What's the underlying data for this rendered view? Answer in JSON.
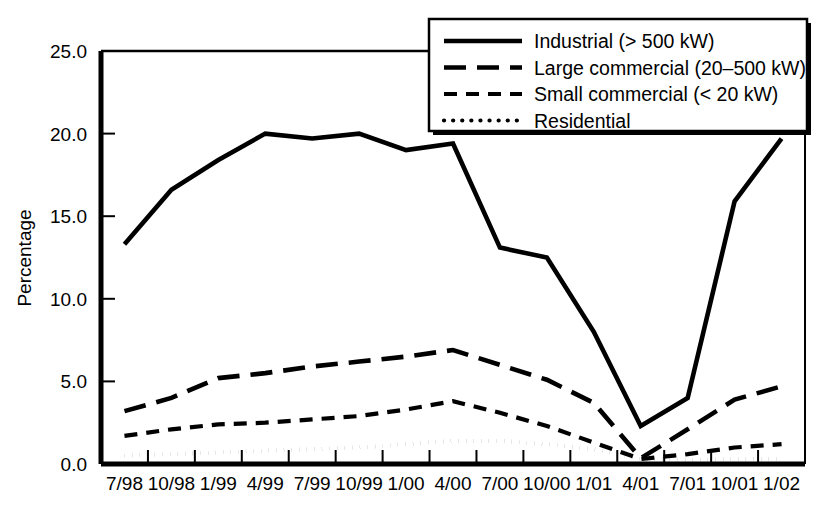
{
  "chart_data": {
    "type": "line",
    "title": "",
    "xlabel": "",
    "ylabel": "Percentage",
    "ylim": [
      0.0,
      25.0
    ],
    "yticks": [
      "0.0",
      "5.0",
      "10.0",
      "15.0",
      "20.0",
      "25.0"
    ],
    "ytick_values": [
      0.0,
      5.0,
      10.0,
      15.0,
      20.0,
      25.0
    ],
    "grid": false,
    "legend_position": "top-right",
    "categories": [
      "7/98",
      "10/98",
      "1/99",
      "4/99",
      "7/99",
      "10/99",
      "1/00",
      "4/00",
      "7/00",
      "10/00",
      "1/01",
      "4/01",
      "7/01",
      "10/01",
      "1/02"
    ],
    "series": [
      {
        "name": "Industrial (> 500 kW)",
        "style": "solid",
        "values": [
          13.3,
          16.6,
          18.4,
          20.0,
          19.7,
          20.0,
          19.0,
          19.4,
          13.1,
          12.5,
          8.0,
          2.3,
          4.0,
          15.9,
          19.7
        ]
      },
      {
        "name": "Large commercial (20–500 kW)",
        "style": "dashed-long",
        "values": [
          3.2,
          4.0,
          5.2,
          5.5,
          5.9,
          6.2,
          6.5,
          6.9,
          6.0,
          5.1,
          3.7,
          0.35,
          2.1,
          3.9,
          4.7
        ]
      },
      {
        "name": "Small commercial (< 20 kW)",
        "style": "dashed-short",
        "values": [
          1.7,
          2.1,
          2.4,
          2.5,
          2.7,
          2.9,
          3.3,
          3.8,
          3.1,
          2.3,
          1.3,
          0.3,
          0.6,
          1.0,
          1.2
        ]
      },
      {
        "name": "Residential",
        "style": "dotted",
        "values": [
          0.5,
          0.6,
          0.7,
          0.8,
          0.9,
          1.0,
          1.2,
          1.4,
          1.4,
          1.2,
          0.9,
          0.3,
          0.25,
          0.3,
          0.3
        ]
      }
    ]
  },
  "legend": {
    "entries": [
      {
        "label": "Industrial (> 500 kW)",
        "style": "solid"
      },
      {
        "label": "Large commercial (20–500 kW)",
        "style": "dashed-long"
      },
      {
        "label": "Small commercial (< 20 kW)",
        "style": "dashed-short"
      },
      {
        "label": "Residential",
        "style": "dotted"
      }
    ]
  },
  "axes": {
    "y_title": "Percentage"
  }
}
